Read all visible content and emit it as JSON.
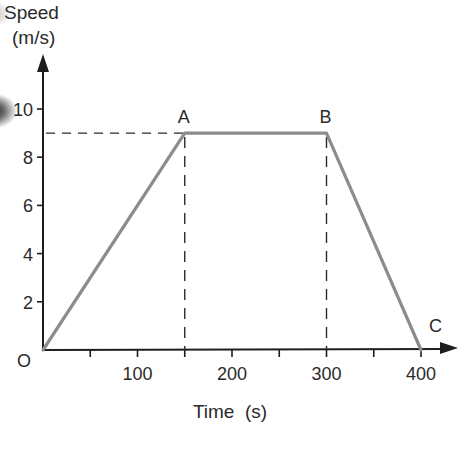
{
  "chart_data": {
    "type": "line",
    "title": "",
    "xlabel": "Time  (s)",
    "ylabel": "Speed\n(m/s)",
    "ylabel_lines": [
      "Speed",
      "(m/s)"
    ],
    "x": [
      0,
      150,
      300,
      400
    ],
    "series": [
      {
        "name": "speed",
        "values": [
          0,
          9,
          9,
          0
        ]
      }
    ],
    "points": [
      {
        "label": "O",
        "t": 0,
        "v": 0
      },
      {
        "label": "A",
        "t": 150,
        "v": 9
      },
      {
        "label": "B",
        "t": 300,
        "v": 9
      },
      {
        "label": "C",
        "t": 400,
        "v": 0
      }
    ],
    "xlim": [
      0,
      430
    ],
    "ylim": [
      0,
      12
    ],
    "x_ticks": [
      50,
      100,
      150,
      200,
      250,
      300,
      350,
      400
    ],
    "x_tick_labels": [
      {
        "value": 100,
        "label": "100"
      },
      {
        "value": 200,
        "label": "200"
      },
      {
        "value": 300,
        "label": "300"
      },
      {
        "value": 400,
        "label": "400"
      }
    ],
    "y_ticks": [
      2,
      4,
      6,
      8,
      10
    ],
    "y_tick_labels": [
      {
        "value": 2,
        "label": "2"
      },
      {
        "value": 4,
        "label": "4"
      },
      {
        "value": 6,
        "label": "6"
      },
      {
        "value": 8,
        "label": "8"
      },
      {
        "value": 10,
        "label": "10"
      }
    ],
    "origin_label": "O",
    "guides": [
      {
        "type": "horizontal-dashed",
        "v": 9,
        "from_t": 0,
        "to_t": 150
      },
      {
        "type": "vertical-dashed",
        "t": 150,
        "from_v": 0,
        "to_v": 9
      },
      {
        "type": "vertical-dashed",
        "t": 300,
        "from_v": 0,
        "to_v": 9
      }
    ],
    "grid": false,
    "legend": "none"
  },
  "colors": {
    "line": "#8c8c8c",
    "axis": "#1e1e1e",
    "text": "#2a2a2a",
    "dash": "#2a2a2a"
  }
}
